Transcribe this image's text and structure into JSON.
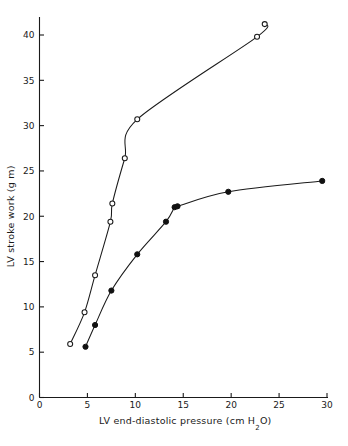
{
  "chart_data": {
    "type": "scatter",
    "title": "",
    "subtitle": "",
    "xlabel": "LV end-diastolic pressure (cm H₂O)",
    "ylabel": "LV stroke work (g m)",
    "xlim": [
      0,
      30
    ],
    "ylim": [
      0,
      42
    ],
    "xticks": [
      0,
      5,
      10,
      15,
      20,
      25,
      30
    ],
    "yticks": [
      0,
      5,
      10,
      15,
      20,
      25,
      30,
      35,
      40
    ],
    "xtick_labels": [
      "0",
      "5",
      "10",
      "15",
      "20",
      "25",
      "30"
    ],
    "ytick_labels": [
      "0",
      "5",
      "10",
      "15",
      "20",
      "25",
      "30",
      "35",
      "40"
    ],
    "grid": false,
    "legend": "none",
    "annotations": [],
    "series": [
      {
        "name": "open-circle-curve",
        "marker": "open-circle",
        "line": "solid",
        "points": [
          {
            "x": 3.2,
            "y": 5.9
          },
          {
            "x": 4.7,
            "y": 9.4
          },
          {
            "x": 5.8,
            "y": 13.5
          },
          {
            "x": 7.4,
            "y": 19.4
          },
          {
            "x": 7.6,
            "y": 21.4
          },
          {
            "x": 8.9,
            "y": 26.4
          },
          {
            "x": 10.2,
            "y": 30.7
          },
          {
            "x": 22.7,
            "y": 39.8
          },
          {
            "x": 23.5,
            "y": 41.2
          }
        ]
      },
      {
        "name": "filled-circle-curve",
        "marker": "filled-circle",
        "line": "solid",
        "points": [
          {
            "x": 4.8,
            "y": 5.6
          },
          {
            "x": 5.8,
            "y": 8.0
          },
          {
            "x": 7.5,
            "y": 11.8
          },
          {
            "x": 10.2,
            "y": 15.8
          },
          {
            "x": 13.2,
            "y": 19.4
          },
          {
            "x": 14.1,
            "y": 21.0
          },
          {
            "x": 14.4,
            "y": 21.1
          },
          {
            "x": 19.7,
            "y": 22.7
          },
          {
            "x": 29.5,
            "y": 23.9
          }
        ]
      }
    ],
    "colors": {
      "axis": "#1a1a1a",
      "curve": "#1a1a1a",
      "open_marker_fill": "#ffffff",
      "filled_marker_fill": "#111111",
      "background": "#ffffff"
    }
  }
}
